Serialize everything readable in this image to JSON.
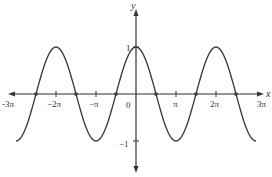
{
  "chart_data": {
    "type": "line",
    "title": "",
    "function": "y = cos(x)",
    "xlabel": "x",
    "ylabel": "y",
    "xlim": [
      -9.42478,
      9.42478
    ],
    "ylim": [
      -1,
      1
    ],
    "grid": false,
    "legend": null,
    "x_ticks": [
      {
        "value": -9.42478,
        "label": "-3π"
      },
      {
        "value": -6.28319,
        "label": "−2π"
      },
      {
        "value": -3.14159,
        "label": "−π"
      },
      {
        "value": 0,
        "label": "0"
      },
      {
        "value": 3.14159,
        "label": "π"
      },
      {
        "value": 6.28319,
        "label": "2π"
      },
      {
        "value": 9.42478,
        "label": "3π"
      }
    ],
    "y_ticks": [
      {
        "value": 1,
        "label": "1"
      },
      {
        "value": -1,
        "label": "−1"
      }
    ],
    "series": [
      {
        "name": "cos x",
        "x": [
          -9.42478,
          -7.85398,
          -6.28319,
          -4.71239,
          -3.14159,
          -1.5708,
          0,
          1.5708,
          3.14159,
          4.71239,
          6.28319,
          7.85398,
          9.42478
        ],
        "values": [
          -1,
          0,
          1,
          0,
          -1,
          0,
          1,
          0,
          -1,
          0,
          1,
          0,
          -1
        ]
      }
    ],
    "marked_points": [
      {
        "x": -7.85398,
        "y": 0
      },
      {
        "x": -4.71239,
        "y": 0
      },
      {
        "x": -1.5708,
        "y": 0
      },
      {
        "x": 1.5708,
        "y": 0
      },
      {
        "x": 4.71239,
        "y": 0
      },
      {
        "x": 7.85398,
        "y": 0
      }
    ]
  },
  "labels": {
    "x_axis": "x",
    "y_axis": "y",
    "origin": "0",
    "y_one": "1",
    "y_neg_one": "−1",
    "neg_3pi": "-3π",
    "neg_2pi": "−2π",
    "neg_pi": "−π",
    "pi": "π",
    "two_pi": "2π",
    "three_pi": "3π"
  },
  "colors": {
    "axis": "#333333",
    "curve": "#333333"
  }
}
